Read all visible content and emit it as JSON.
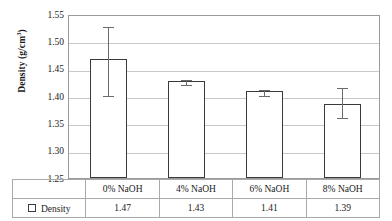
{
  "chart_data": {
    "type": "bar",
    "title": "",
    "xlabel": "",
    "ylabel": "Density (g/cm",
    "ylabel_sup": "3",
    "ylabel_suffix": ")",
    "categories": [
      "0% NaOH",
      "4% NaOH",
      "6% NaOH",
      "8% NaOH"
    ],
    "values": [
      1.468,
      1.428,
      1.409,
      1.386
    ],
    "labels": [
      "1.47",
      "1.43",
      "1.41",
      "1.39"
    ],
    "errors_upper": [
      0.062,
      0.005,
      0.005,
      0.032
    ],
    "errors_lower": [
      0.065,
      0.005,
      0.006,
      0.023
    ],
    "series_name": "Density",
    "ylim": [
      1.25,
      1.55
    ],
    "yticks": [
      "1.55",
      "1.50",
      "1.45",
      "1.40",
      "1.35",
      "1.30",
      "1.25"
    ],
    "ytick_values": [
      1.55,
      1.5,
      1.45,
      1.4,
      1.35,
      1.3,
      1.25
    ],
    "grid": true,
    "legend_position": "bottom-table",
    "bar_color": "#ffffff",
    "bar_edge_color": "#3a3a3a",
    "gridline_color": "#c8c8c8",
    "error_color": "#6b6b6b"
  }
}
